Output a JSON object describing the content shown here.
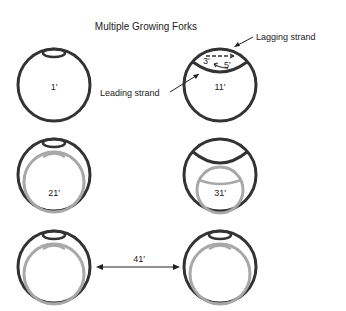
{
  "title": "Multiple Growing Forks",
  "labels": {
    "leading_strand": "Leading strand",
    "lagging_strand": "Lagging strand",
    "three_prime": "3′",
    "five_prime": "5′"
  },
  "stages": [
    {
      "id": "stage-1",
      "label": "1′"
    },
    {
      "id": "stage-11",
      "label": "11′"
    },
    {
      "id": "stage-21",
      "label": "21′"
    },
    {
      "id": "stage-31",
      "label": "31′"
    },
    {
      "id": "stage-41",
      "label": "41′"
    }
  ],
  "colors": {
    "dark_strand": "#333333",
    "new_strand": "#a8a8a8",
    "text": "#222222"
  }
}
